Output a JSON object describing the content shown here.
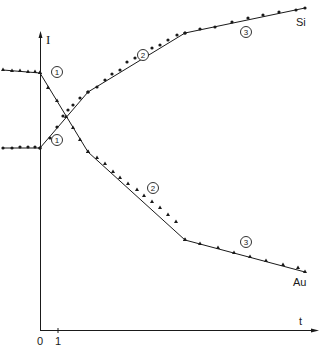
{
  "chart_data": {
    "type": "line",
    "title": "",
    "xlabel": "t",
    "ylabel": "I",
    "x_ticks": [
      "0",
      "1"
    ],
    "grid": false,
    "legend": "inline labels at curve ends",
    "series": [
      {
        "name": "Si",
        "marker": "circle",
        "segments": [
          {
            "region": "pre-sputter (t<0)",
            "trend": "flat",
            "points_px": [
              [
                3,
                148
              ],
              [
                12,
                148
              ],
              [
                20,
                147
              ],
              [
                28,
                147
              ],
              [
                35,
                147
              ],
              [
                40,
                148
              ]
            ]
          },
          {
            "region": "1",
            "trend": "rising steeply",
            "points_px": [
              [
                40,
                148
              ],
              [
                50,
                138
              ],
              [
                57,
                127
              ],
              [
                63,
                116
              ],
              [
                68,
                110
              ],
              [
                73,
                105
              ],
              [
                80,
                98
              ],
              [
                88,
                92
              ]
            ]
          },
          {
            "region": "2",
            "trend": "rising",
            "points_px": [
              [
                88,
                92
              ],
              [
                97,
                87
              ],
              [
                105,
                80
              ],
              [
                112,
                74
              ],
              [
                120,
                70
              ],
              [
                127,
                62
              ],
              [
                135,
                58
              ],
              [
                143,
                54
              ],
              [
                152,
                48
              ],
              [
                160,
                45
              ],
              [
                168,
                40
              ],
              [
                177,
                35
              ],
              [
                185,
                33
              ]
            ]
          },
          {
            "region": "3",
            "trend": "rising slowly",
            "points_px": [
              [
                185,
                33
              ],
              [
                200,
                29
              ],
              [
                215,
                27
              ],
              [
                232,
                22
              ],
              [
                248,
                18
              ],
              [
                263,
                15
              ],
              [
                279,
                12
              ],
              [
                296,
                10
              ],
              [
                305,
                8
              ]
            ]
          }
        ]
      },
      {
        "name": "Au",
        "marker": "triangle",
        "segments": [
          {
            "region": "pre-sputter (t<0)",
            "trend": "flat",
            "points_px": [
              [
                3,
                70
              ],
              [
                12,
                71
              ],
              [
                20,
                71
              ],
              [
                28,
                72
              ],
              [
                35,
                72
              ],
              [
                40,
                73
              ]
            ]
          },
          {
            "region": "1",
            "trend": "falling steeply",
            "points_px": [
              [
                40,
                73
              ],
              [
                48,
                88
              ],
              [
                57,
                101
              ],
              [
                66,
                117
              ],
              [
                73,
                128
              ],
              [
                80,
                140
              ],
              [
                88,
                152
              ]
            ]
          },
          {
            "region": "2",
            "trend": "falling",
            "points_px": [
              [
                88,
                152
              ],
              [
                97,
                158
              ],
              [
                105,
                164
              ],
              [
                113,
                172
              ],
              [
                120,
                178
              ],
              [
                128,
                184
              ],
              [
                137,
                190
              ],
              [
                144,
                196
              ],
              [
                152,
                202
              ],
              [
                160,
                208
              ],
              [
                168,
                215
              ],
              [
                176,
                222
              ],
              [
                185,
                240
              ]
            ]
          },
          {
            "region": "3",
            "trend": "falling slowly",
            "points_px": [
              [
                185,
                240
              ],
              [
                200,
                244
              ],
              [
                218,
                248
              ],
              [
                234,
                253
              ],
              [
                250,
                257
              ],
              [
                266,
                261
              ],
              [
                283,
                265
              ],
              [
                298,
                268
              ],
              [
                305,
                272
              ]
            ]
          }
        ]
      }
    ],
    "annotations": [
      {
        "text": "1",
        "style": "circled",
        "near": "Au region 1",
        "px": [
          57,
          72
        ]
      },
      {
        "text": "1",
        "style": "circled",
        "near": "Si region 1",
        "px": [
          57,
          140
        ]
      },
      {
        "text": "2",
        "style": "circled",
        "near": "Si region 2",
        "px": [
          143,
          55
        ]
      },
      {
        "text": "2",
        "style": "circled",
        "near": "Au region 2",
        "px": [
          153,
          188
        ]
      },
      {
        "text": "3",
        "style": "circled",
        "near": "Si region 3",
        "px": [
          246,
          32
        ]
      },
      {
        "text": "3",
        "style": "circled",
        "near": "Au region 3",
        "px": [
          246,
          242
        ]
      }
    ]
  },
  "labels": {
    "y_axis": "I",
    "x_axis": "t",
    "tick_0": "0",
    "tick_1": "1",
    "series_si": "Si",
    "series_au": "Au",
    "region_1": "1",
    "region_2": "2",
    "region_3": "3"
  },
  "colors": {
    "ink": "#1a1a1a",
    "background": "#ffffff"
  }
}
